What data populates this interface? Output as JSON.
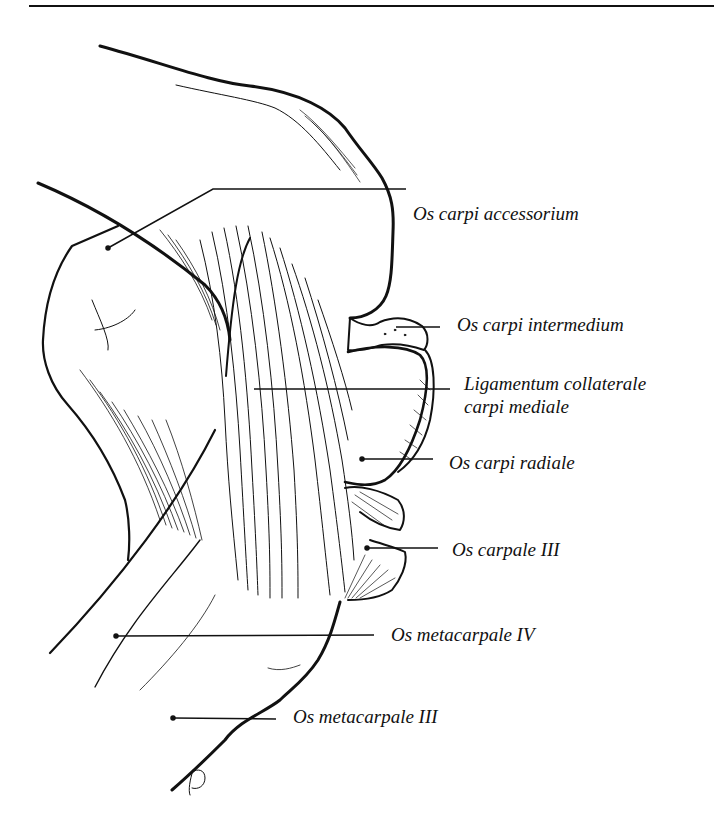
{
  "figure": {
    "type": "anatomical-illustration",
    "signature": "JD",
    "ink_color": "#111111",
    "background": "#ffffff"
  },
  "labels": [
    {
      "id": "os-carpi-accessorium",
      "text": "Os carpi accessorium",
      "x": 413,
      "y": 203,
      "leader": {
        "from": [
          108,
          248
        ],
        "knee": [
          213,
          189
        ],
        "to": [
          406,
          189
        ]
      }
    },
    {
      "id": "os-carpi-intermedium",
      "text": "Os carpi intermedium",
      "x": 457,
      "y": 314,
      "leader": {
        "from": [
          396,
          327
        ],
        "to": [
          440,
          327
        ]
      }
    },
    {
      "id": "ligamentum-collaterale",
      "text": "Ligamentum collaterale",
      "line2": "carpi mediale",
      "x": 464,
      "y": 373,
      "leader": {
        "from": [
          254,
          389
        ],
        "to": [
          450,
          389
        ]
      }
    },
    {
      "id": "os-carpi-radiale",
      "text": "Os carpi radiale",
      "x": 449,
      "y": 452,
      "leader": {
        "from": [
          362,
          459
        ],
        "to": [
          433,
          459
        ]
      }
    },
    {
      "id": "os-carpale-iii",
      "text": "Os carpale III",
      "x": 452,
      "y": 539,
      "leader": {
        "from": [
          367,
          548
        ],
        "to": [
          438,
          548
        ]
      }
    },
    {
      "id": "os-metacarpale-iv",
      "text": "Os metacarpale IV",
      "x": 391,
      "y": 624,
      "leader": {
        "from": [
          116,
          636
        ],
        "to": [
          374,
          635
        ]
      }
    },
    {
      "id": "os-metacarpale-iii",
      "text": "Os metacarpale III",
      "x": 293,
      "y": 706,
      "leader": {
        "from": [
          173,
          718
        ],
        "to": [
          276,
          719
        ]
      }
    }
  ]
}
